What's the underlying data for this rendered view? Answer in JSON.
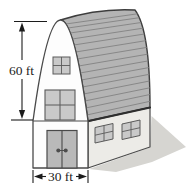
{
  "figure": {
    "height_dimension": {
      "label": "60 ft"
    },
    "width_dimension": {
      "label": "30 ft"
    },
    "colors": {
      "background": "#ffffff",
      "roof": "#b4b4b4",
      "roof_stripe": "#828282",
      "roof_outline": "#3d3d3d",
      "front_wall": "#fdfdfd",
      "side_wall": "#ecebe7",
      "wall_outline": "#4a4a4a",
      "window_fill": "#c9c9c9",
      "window_frame": "#5a5a5a",
      "door_fill": "#b9b9b9",
      "door_handle": "#4d4d4d",
      "shadow": "#d6d5d1",
      "dimension": "#1c1c1c"
    }
  }
}
